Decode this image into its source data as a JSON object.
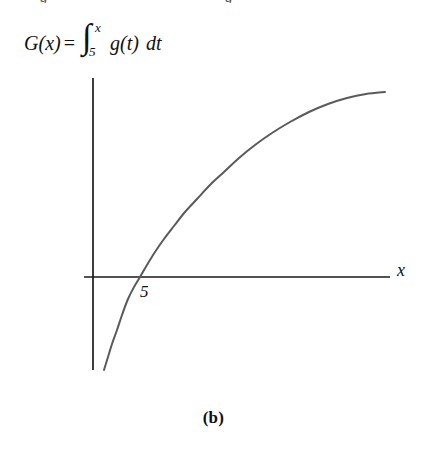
{
  "figure": {
    "caption": "(b)",
    "top_clipped_fragment_left": "g",
    "top_clipped_fragment_right": "g"
  },
  "formula": {
    "function_name": "G",
    "open_paren": "(",
    "argument": "x",
    "close_paren": ")",
    "equals": "=",
    "integral_sign": "∫",
    "upper_limit": "x",
    "lower_limit": "5",
    "integrand_name": "g",
    "integrand_open": "(",
    "integrand_var": "t",
    "integrand_close": ")",
    "differential": "dt",
    "full_text": "G(x) = ∫₅ˣ g(t) dt"
  },
  "axes": {
    "x_axis_label": "x",
    "x_intercept_label": "5",
    "x_axis_color": "#1a1a1a",
    "y_axis_color": "#1a1a1a",
    "x_axis_y_px": 277,
    "y_axis_x_px": 93,
    "x_axis_start_px": 84,
    "x_axis_end_px": 390,
    "y_axis_top_px": 78,
    "y_axis_bottom_px": 370
  },
  "chart_data": {
    "type": "line",
    "title": "",
    "subtitle": "",
    "xlabel": "x",
    "ylabel": "",
    "grid": false,
    "legend": null,
    "annotations": [
      {
        "text": "5",
        "x": 5,
        "y": 0,
        "note": "x-intercept of G(x); G(5)=0"
      },
      {
        "text": "G(x) = ∫₅ˣ g(t) dt",
        "note": "accumulation function definition"
      },
      {
        "text": "(b)",
        "note": "figure part label"
      }
    ],
    "curve_color": "#5a5a5a",
    "curve_width_px": 2,
    "xlim": [
      3.0,
      14.0
    ],
    "ylim": [
      -3.2,
      2.1
    ],
    "series": [
      {
        "name": "G(x)",
        "x": [
          3.35,
          3.6,
          3.9,
          4.2,
          4.5,
          4.8,
          5.0,
          5.4,
          5.9,
          6.5,
          7.1,
          7.8,
          8.5,
          9.3,
          10.1,
          11.0,
          11.9,
          12.8,
          13.6
        ],
        "y": [
          -3.1,
          -2.55,
          -2.0,
          -1.5,
          -1.05,
          -0.3,
          0.0,
          0.38,
          0.72,
          1.02,
          1.26,
          1.47,
          1.63,
          1.76,
          1.86,
          1.94,
          1.99,
          2.03,
          2.05
        ]
      }
    ],
    "pixel_path": {
      "note": "curve polyline in screenshot pixel coordinates",
      "points": [
        [
          104,
          370
        ],
        [
          108,
          357
        ],
        [
          112,
          344
        ],
        [
          117,
          330
        ],
        [
          122,
          315
        ],
        [
          128,
          299
        ],
        [
          134,
          287
        ],
        [
          140,
          277
        ],
        [
          147,
          265
        ],
        [
          155,
          252
        ],
        [
          164,
          239
        ],
        [
          174,
          226
        ],
        [
          185,
          212
        ],
        [
          197,
          199
        ],
        [
          210,
          185
        ],
        [
          224,
          172
        ],
        [
          239,
          158
        ],
        [
          255,
          145
        ],
        [
          272,
          133
        ],
        [
          290,
          122
        ],
        [
          309,
          112
        ],
        [
          328,
          104
        ],
        [
          347,
          98
        ],
        [
          366,
          94
        ],
        [
          385,
          92
        ]
      ]
    }
  }
}
